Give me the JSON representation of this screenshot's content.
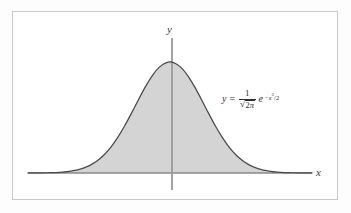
{
  "figure": {
    "kind": "gaussian-curve-figure",
    "background_color": "#ffffff",
    "frame_color": "#c9c9c9",
    "fill_color": "#d4d4d4",
    "curve_color": "#4a4a4a",
    "axis_color": "#8a8a8a",
    "axis_label_color": "#3b3b3b"
  },
  "labels": {
    "y_axis": "y",
    "x_axis": "x"
  },
  "equation": {
    "full_text": "y = 1/√(2π) e^(−x²/2)",
    "lhs": "y",
    "operator": "=",
    "fraction_numerator": "1",
    "sqrt_sign": "√",
    "fraction_denominator_radicand_number": "2",
    "fraction_denominator_radicand_symbol": "π",
    "exponential_base": "e",
    "exponent_minus": "−",
    "exponent_variable": "x",
    "exponent_power": "2",
    "exponent_divider": "/",
    "exponent_denominator": "2"
  },
  "chart_data": {
    "type": "line",
    "title": "",
    "subtitle": "",
    "xlabel": "x",
    "ylabel": "y",
    "legend": [],
    "legend_position": "none",
    "grid": false,
    "annotations": [
      {
        "text": "y = 1/√(2π) e^(−x²/2)",
        "x": 1.55,
        "y": 0.28
      }
    ],
    "xlim": [
      -4.1,
      4.1
    ],
    "ylim": [
      0,
      0.44
    ],
    "x_axis_position_y": 0,
    "y_axis_position_x": 0,
    "shaded_area": {
      "enabled": true,
      "from_x": -4.1,
      "to_x": 4.1,
      "color": "#d4d4d4"
    },
    "series": [
      {
        "name": "standard normal density",
        "formula": "y = (1/sqrt(2*pi)) * exp(-x^2/2)",
        "x": [
          -4.1,
          -3.9,
          -3.7,
          -3.5,
          -3.3,
          -3.1,
          -2.9,
          -2.7,
          -2.5,
          -2.3,
          -2.1,
          -1.9,
          -1.7,
          -1.5,
          -1.3,
          -1.1,
          -0.9,
          -0.7,
          -0.5,
          -0.3,
          -0.1,
          0.1,
          0.3,
          0.5,
          0.7,
          0.9,
          1.1,
          1.3,
          1.5,
          1.7,
          1.9,
          2.1,
          2.3,
          2.5,
          2.7,
          2.9,
          3.1,
          3.3,
          3.5,
          3.7,
          3.9,
          4.1
        ],
        "y": [
          0.0001,
          0.0002,
          0.0004,
          0.0009,
          0.0017,
          0.0033,
          0.006,
          0.0104,
          0.0175,
          0.0283,
          0.044,
          0.0656,
          0.094,
          0.1295,
          0.1714,
          0.2179,
          0.2661,
          0.3123,
          0.3521,
          0.3814,
          0.397,
          0.397,
          0.3814,
          0.3521,
          0.3123,
          0.2661,
          0.2179,
          0.1714,
          0.1295,
          0.094,
          0.0656,
          0.044,
          0.0283,
          0.0175,
          0.0104,
          0.006,
          0.0033,
          0.0017,
          0.0009,
          0.0004,
          0.0002,
          0.0001
        ]
      }
    ],
    "peak": {
      "x": 0,
      "y": 0.3989
    }
  }
}
